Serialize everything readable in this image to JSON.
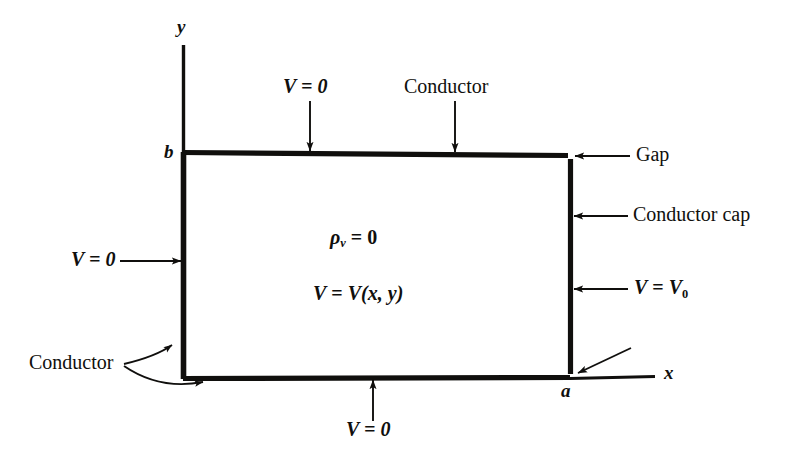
{
  "figure": {
    "background_color": "#ffffff",
    "ink_color": "#100f0d",
    "axes": {
      "x_label": "x",
      "y_label": "y",
      "x_tick_label": "a",
      "y_tick_label": "b"
    },
    "interior": {
      "charge_density": {
        "symbol": "ρ",
        "subscript": "v",
        "relation": "=",
        "value": "0"
      },
      "potential_function": {
        "lhs": "V",
        "relation": "=",
        "rhs": "V(x, y)"
      }
    },
    "annotations": {
      "top_potential": "V = 0",
      "top_conductor": "Conductor",
      "left_potential": "V = 0",
      "left_conductor": "Conductor",
      "bottom_potential": "V = 0",
      "top_gap": "Gap",
      "bottom_gap": "Gap",
      "conductor_cap": "Conductor cap",
      "right_potential_lhs": "V",
      "right_potential_rel": "=",
      "right_potential_rhs": "V",
      "right_potential_sub": "0"
    }
  }
}
